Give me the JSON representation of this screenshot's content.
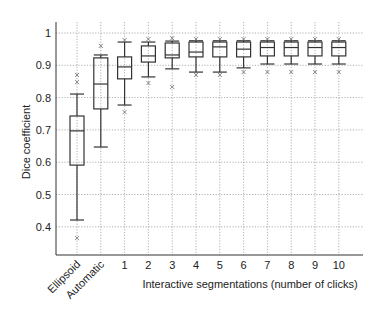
{
  "chart_data": {
    "type": "box",
    "title": "",
    "xlabel": "Interactive segmentations (number of clicks)",
    "ylabel": "Dice coefficient",
    "ylim": [
      0.31,
      1.05
    ],
    "yticks": [
      0.4,
      0.5,
      0.6,
      0.7,
      0.8,
      0.9,
      1
    ],
    "ytick_labels": [
      "0.4",
      "0.5",
      "0.6",
      "0.7",
      "0.8",
      "0.9",
      "1"
    ],
    "grid": true,
    "legend": null,
    "categories": [
      "Ellipsoid",
      "Automatic",
      "1",
      "2",
      "3",
      "4",
      "5",
      "6",
      "7",
      "8",
      "9",
      "10"
    ],
    "rotated_categories": [
      "Ellipsoid",
      "Automatic"
    ],
    "series": [
      {
        "name": "Ellipsoid",
        "whisker_low": 0.421,
        "q1": 0.591,
        "median": 0.697,
        "q3": 0.743,
        "whisker_high": 0.811,
        "outliers": [
          0.365,
          0.848,
          0.87
        ]
      },
      {
        "name": "Automatic",
        "whisker_low": 0.647,
        "q1": 0.765,
        "median": 0.842,
        "q3": 0.923,
        "whisker_high": 0.932,
        "outliers": [
          0.96
        ]
      },
      {
        "name": "1",
        "whisker_low": 0.777,
        "q1": 0.858,
        "median": 0.895,
        "q3": 0.926,
        "whisker_high": 0.972,
        "outliers": [
          0.755,
          0.978
        ]
      },
      {
        "name": "2",
        "whisker_low": 0.864,
        "q1": 0.91,
        "median": 0.929,
        "q3": 0.96,
        "whisker_high": 0.972,
        "outliers": [
          0.845,
          0.981
        ]
      },
      {
        "name": "3",
        "whisker_low": 0.889,
        "q1": 0.923,
        "median": 0.932,
        "q3": 0.969,
        "whisker_high": 0.975,
        "outliers": [
          0.833,
          0.984
        ]
      },
      {
        "name": "4",
        "whisker_low": 0.879,
        "q1": 0.926,
        "median": 0.941,
        "q3": 0.972,
        "whisker_high": 0.976,
        "outliers": [
          0.87,
          0.981
        ]
      },
      {
        "name": "5",
        "whisker_low": 0.879,
        "q1": 0.926,
        "median": 0.957,
        "q3": 0.972,
        "whisker_high": 0.976,
        "outliers": [
          0.87,
          0.981
        ]
      },
      {
        "name": "6",
        "whisker_low": 0.892,
        "q1": 0.926,
        "median": 0.95,
        "q3": 0.972,
        "whisker_high": 0.976,
        "outliers": [
          0.879,
          0.981
        ]
      },
      {
        "name": "7",
        "whisker_low": 0.904,
        "q1": 0.929,
        "median": 0.955,
        "q3": 0.972,
        "whisker_high": 0.976,
        "outliers": [
          0.879,
          0.981
        ]
      },
      {
        "name": "8",
        "whisker_low": 0.904,
        "q1": 0.929,
        "median": 0.955,
        "q3": 0.972,
        "whisker_high": 0.976,
        "outliers": [
          0.879,
          0.981
        ]
      },
      {
        "name": "9",
        "whisker_low": 0.904,
        "q1": 0.929,
        "median": 0.955,
        "q3": 0.972,
        "whisker_high": 0.976,
        "outliers": [
          0.879,
          0.981
        ]
      },
      {
        "name": "10",
        "whisker_low": 0.904,
        "q1": 0.929,
        "median": 0.955,
        "q3": 0.972,
        "whisker_high": 0.976,
        "outliers": [
          0.879,
          0.981
        ]
      }
    ],
    "colors": {
      "box": "#333333",
      "grid": "#9a9a9a",
      "axis": "#333333",
      "outlier": "#777777"
    }
  }
}
